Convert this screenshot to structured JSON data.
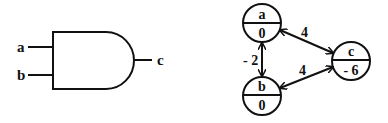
{
  "gate": {
    "type": "AND",
    "inputs": [
      {
        "label": "a"
      },
      {
        "label": "b"
      }
    ],
    "output": {
      "label": "c"
    }
  },
  "graph": {
    "nodes": [
      {
        "id": "a",
        "name": "a",
        "value": "0"
      },
      {
        "id": "b",
        "name": "b",
        "value": "0"
      },
      {
        "id": "c",
        "name": "c",
        "value": "- 6"
      }
    ],
    "edges": [
      {
        "from": "a",
        "to": "b",
        "weight": "- 2",
        "bidirectional": true
      },
      {
        "from": "a",
        "to": "c",
        "weight": "4",
        "bidirectional": true
      },
      {
        "from": "b",
        "to": "c",
        "weight": "4",
        "bidirectional": true
      }
    ]
  }
}
